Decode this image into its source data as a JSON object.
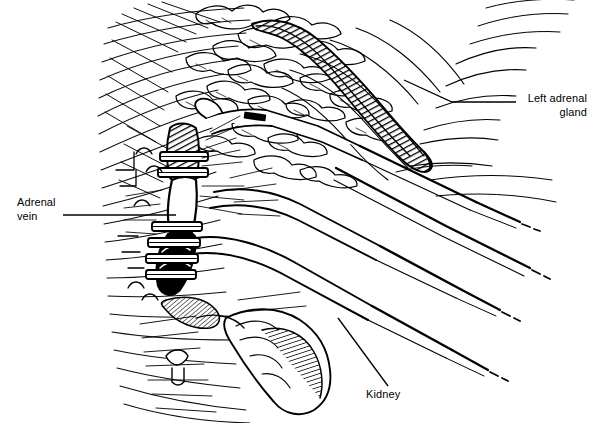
{
  "figure": {
    "kind": "medical-line-illustration",
    "width": 593,
    "height": 423,
    "background_color": "#ffffff",
    "ink_color": "#000000"
  },
  "labels": {
    "adrenal_vein": {
      "line1": "Adrenal",
      "line2": "vein"
    },
    "left_adrenal_gland": {
      "line1": "Left adrenal",
      "line2": "gland"
    },
    "kidney": {
      "text": "Kidney"
    }
  },
  "leaders": {
    "adrenal_vein_leader": "horizontal-line-right",
    "left_adrenal_gland_leader": "horizontal-then-angled-up-left",
    "kidney_leader": "diagonal-up-left"
  },
  "anatomy": [
    {
      "name": "left-adrenal-gland",
      "rendering": "dark-hatched-curved-band"
    },
    {
      "name": "adrenal-vein",
      "rendering": "dark-vessel-with-clips"
    },
    {
      "name": "kidney",
      "rendering": "hatched-lower-mass"
    },
    {
      "name": "retroperitoneal-fat",
      "rendering": "lobular-stippled-tissue"
    }
  ],
  "instruments": [
    {
      "name": "grasper-shaft-upper",
      "rendering": "tapered-double-line-shaft"
    },
    {
      "name": "retractor-shaft-middle",
      "rendering": "tapered-double-line-shaft"
    },
    {
      "name": "dissector-shaft-lower",
      "rendering": "tapered-double-line-shaft"
    },
    {
      "name": "clip-applier",
      "rendering": "tapered-double-line-shaft"
    }
  ]
}
